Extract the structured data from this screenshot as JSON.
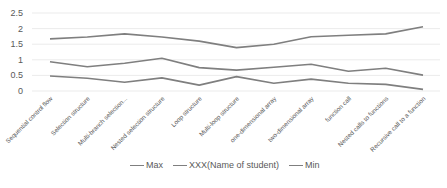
{
  "chart_data": {
    "type": "line",
    "title": "",
    "xlabel": "",
    "ylabel": "",
    "ylim": [
      0,
      2.5
    ],
    "yticks": [
      "0",
      "0.5",
      "1",
      "1.5",
      "2",
      "2.5"
    ],
    "ytick_values": [
      0,
      0.5,
      1,
      1.5,
      2,
      2.5
    ],
    "grid": true,
    "legend_position": "bottom",
    "categories": [
      "Sequential control flow",
      "Selection structure",
      "Multi-branch selection...",
      "Nested selection structure",
      "Loop structure",
      "Multi-loop structure",
      "one-dimensional array",
      "two-dimensional array",
      "function call",
      "Nested calls to functions",
      "Recursive call to a function"
    ],
    "series": [
      {
        "name": "Max",
        "color": "#7f7f7f",
        "values": [
          1.67,
          1.73,
          1.83,
          1.73,
          1.6,
          1.39,
          1.5,
          1.74,
          1.79,
          1.83,
          2.06
        ]
      },
      {
        "name": "XXX(Name of student)",
        "color": "#7f7f7f",
        "values": [
          0.94,
          0.78,
          0.89,
          1.05,
          0.75,
          0.67,
          0.76,
          0.86,
          0.63,
          0.73,
          0.51
        ]
      },
      {
        "name": "Min",
        "color": "#7f7f7f",
        "values": [
          0.48,
          0.41,
          0.28,
          0.42,
          0.19,
          0.46,
          0.25,
          0.38,
          0.25,
          0.21,
          0.05
        ]
      }
    ]
  }
}
